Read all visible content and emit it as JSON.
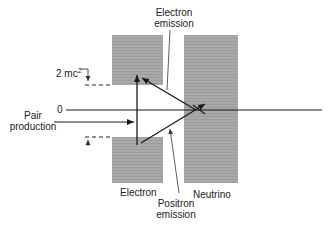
{
  "diagram": {
    "labels": {
      "electron_emission_line1": "Electron",
      "electron_emission_line2": "emission",
      "two_mc2": "2 mc",
      "two_mc2_sup": "2",
      "zero": "0",
      "pair_production_line1": "Pair",
      "pair_production_line2": "production",
      "electron": "Electron",
      "neutrino": "Neutrino",
      "positron_emission_line1": "Positron",
      "positron_emission_line2": "emission"
    },
    "colors": {
      "band_fill": "#a8a8a8",
      "line": "#1a1a1a"
    }
  }
}
